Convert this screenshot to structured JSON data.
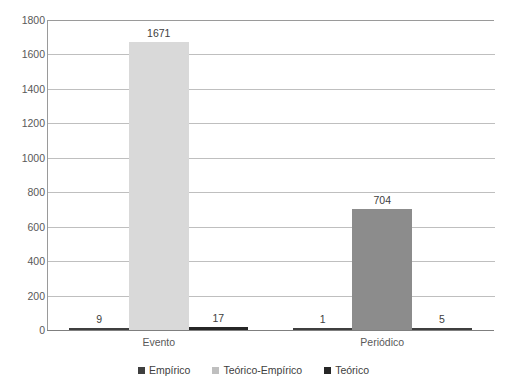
{
  "chart_data": {
    "type": "bar",
    "title": "",
    "xlabel": "",
    "ylabel": "",
    "categories": [
      "Evento",
      "Periódico"
    ],
    "series": [
      {
        "name": "Empírico",
        "values": [
          9,
          1
        ],
        "color": "#404040"
      },
      {
        "name": "Teórico-Empírico",
        "values": [
          1671,
          704
        ],
        "color": "#d9d9d9"
      },
      {
        "name": "Teórico",
        "values": [
          17,
          5
        ],
        "color": "#262626"
      }
    ],
    "point_colors": [
      [
        "#3f3f3f",
        "#3f3f3f"
      ],
      [
        "#d9d9d9",
        "#8c8c8c"
      ],
      [
        "#262626",
        "#3f3f3f"
      ]
    ],
    "ylim": [
      0,
      1800
    ],
    "ytick_step": 200,
    "yticks": [
      "1800",
      "1600",
      "1400",
      "1200",
      "1000",
      "800",
      "600",
      "400",
      "200",
      "0"
    ],
    "grid": true,
    "legend_position": "bottom",
    "data_labels": [
      [
        "9",
        "1"
      ],
      [
        "1671",
        "704"
      ],
      [
        "17",
        "5"
      ]
    ]
  },
  "legend": {
    "items": [
      {
        "label": "Empírico",
        "color": "#3f3f3f"
      },
      {
        "label": "Teórico-Empírico",
        "color": "#bfbfbf"
      },
      {
        "label": "Teórico",
        "color": "#262626"
      }
    ]
  },
  "axis": {
    "x_categories": [
      "Evento",
      "Periódico"
    ],
    "y_labels": [
      "1800",
      "1600",
      "1400",
      "1200",
      "1000",
      "800",
      "600",
      "400",
      "200",
      "0"
    ]
  },
  "title_partial": ""
}
